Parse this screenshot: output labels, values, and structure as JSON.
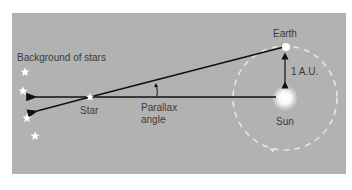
{
  "diagram": {
    "labels": {
      "background_stars": "Background of stars",
      "earth": "Earth",
      "distance": "1 A.U.",
      "star": "Star",
      "parallax_line1": "Parallax",
      "parallax_line2": "angle",
      "sun": "Sun"
    },
    "colors": {
      "background": "#b2b2b2",
      "lines": "#111111",
      "orbit": "#eeeeee",
      "text": "#3a3a3a",
      "stars": "#ffffff"
    },
    "background_star_count": 4
  }
}
